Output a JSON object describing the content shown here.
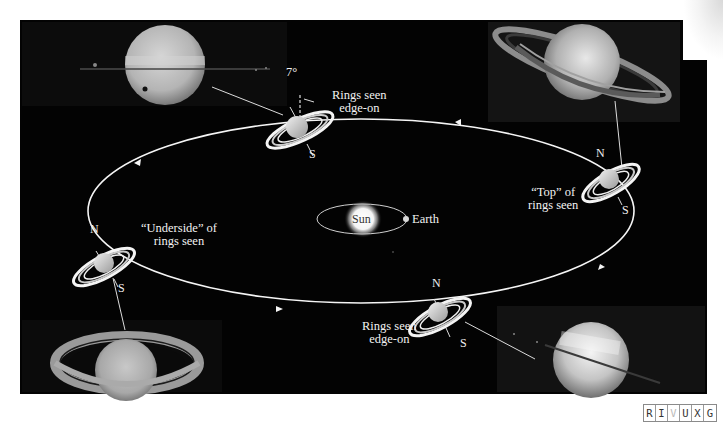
{
  "figure": {
    "tilt_angle_label": "7°",
    "center": {
      "sun_label": "Sun",
      "earth_label": "Earth"
    },
    "orbit_positions": [
      {
        "id": "top",
        "label_line1": "Rings seen",
        "label_line2": "edge-on",
        "pole_north": "N",
        "pole_south": "S"
      },
      {
        "id": "right",
        "label_line1": "“Top” of",
        "label_line2": "rings seen",
        "pole_north": "N",
        "pole_south": "S"
      },
      {
        "id": "bottom",
        "label_line1": "Rings seen",
        "label_line2": "edge-on",
        "pole_north": "N",
        "pole_south": "S"
      },
      {
        "id": "left",
        "label_line1": "“Underside” of",
        "label_line2": "rings seen",
        "pole_north": "N",
        "pole_south": "S"
      }
    ],
    "photos": [
      {
        "id": "photo-top-left",
        "view": "rings edge-on"
      },
      {
        "id": "photo-top-right",
        "view": "top of rings"
      },
      {
        "id": "photo-bottom-left",
        "view": "underside of rings"
      },
      {
        "id": "photo-bottom-right",
        "view": "rings edge-on"
      }
    ]
  },
  "wavelength_badge": {
    "letters": [
      "R",
      "I",
      "V",
      "U",
      "X",
      "G"
    ],
    "active": "V"
  },
  "colors": {
    "background": "#030303",
    "orbit_line": "#f5f5f5",
    "page": "#ffffff"
  }
}
